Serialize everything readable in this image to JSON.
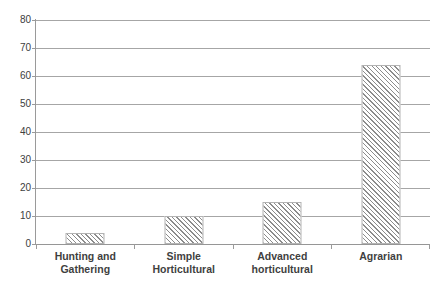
{
  "chart_data": {
    "type": "bar",
    "title": "",
    "subtitle": "",
    "xlabel": "",
    "ylabel": "",
    "categories": [
      "Hunting and Gathering",
      "Simple Horticultural",
      "Advanced horticultural",
      "Agrarian"
    ],
    "category_lines": [
      [
        "Hunting and",
        "Gathering"
      ],
      [
        "Simple Horticultural"
      ],
      [
        "Advanced",
        "horticultural"
      ],
      [
        "Agrarian"
      ]
    ],
    "values": [
      4,
      10,
      15,
      64
    ],
    "ylim": [
      0,
      80
    ],
    "ytick_step": 10,
    "yticks": [
      0,
      10,
      20,
      30,
      40,
      50,
      60,
      70,
      80
    ],
    "ytick_labels": [
      "0",
      "10",
      "20",
      "30",
      "40",
      "50",
      "60",
      "70",
      "80"
    ],
    "grid": true,
    "grid_axis": "y",
    "legend": false,
    "legend_position": "none",
    "bar_fill": "hatch-diagonal",
    "bar_fill_color": "#8c8c8c",
    "bar_border_color": "#b3b3b3",
    "gridline_color": "#a6a6a6",
    "axis_color": "#9a9a9a",
    "label_color": "#3f3f3f",
    "background": "#ffffff"
  }
}
